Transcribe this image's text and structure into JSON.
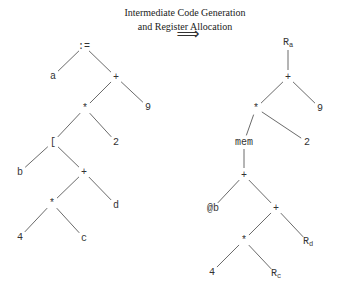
{
  "caption": {
    "line1": "Intermediate Code Generation",
    "line2": "and Register Allocation",
    "arrow": "⟹"
  },
  "left_tree": {
    "nodes": [
      {
        "id": "L0",
        "label": ":=",
        "x": 84,
        "y": 46
      },
      {
        "id": "L1",
        "label": "a",
        "x": 53,
        "y": 76
      },
      {
        "id": "L2",
        "label": "+",
        "x": 116,
        "y": 77
      },
      {
        "id": "L3",
        "label": "*",
        "x": 85,
        "y": 108
      },
      {
        "id": "L4",
        "label": "9",
        "x": 148,
        "y": 107
      },
      {
        "id": "L5",
        "label": "[",
        "x": 53,
        "y": 142
      },
      {
        "id": "L6",
        "label": "2",
        "x": 116,
        "y": 142
      },
      {
        "id": "L7",
        "label": "b",
        "x": 20,
        "y": 172
      },
      {
        "id": "L8",
        "label": "+",
        "x": 84,
        "y": 172
      },
      {
        "id": "L9",
        "label": "*",
        "x": 52,
        "y": 203
      },
      {
        "id": "L10",
        "label": "d",
        "x": 116,
        "y": 205
      },
      {
        "id": "L11",
        "label": "4",
        "x": 20,
        "y": 237
      },
      {
        "id": "L12",
        "label": "c",
        "x": 84,
        "y": 238
      }
    ],
    "edges": [
      [
        "L0",
        "L1"
      ],
      [
        "L0",
        "L2"
      ],
      [
        "L2",
        "L3"
      ],
      [
        "L2",
        "L4"
      ],
      [
        "L3",
        "L5"
      ],
      [
        "L3",
        "L6"
      ],
      [
        "L5",
        "L7"
      ],
      [
        "L5",
        "L8"
      ],
      [
        "L8",
        "L9"
      ],
      [
        "L8",
        "L10"
      ],
      [
        "L9",
        "L11"
      ],
      [
        "L9",
        "L12"
      ]
    ]
  },
  "right_tree": {
    "nodes": [
      {
        "id": "R0",
        "label": "R",
        "sub": "a",
        "x": 288,
        "y": 43
      },
      {
        "id": "R1",
        "label": "+",
        "x": 288,
        "y": 77
      },
      {
        "id": "R2",
        "label": "*",
        "x": 256,
        "y": 108
      },
      {
        "id": "R3",
        "label": "9",
        "x": 320,
        "y": 108
      },
      {
        "id": "R4",
        "label": "mem",
        "x": 244,
        "y": 142
      },
      {
        "id": "R5",
        "label": "2",
        "x": 307,
        "y": 142
      },
      {
        "id": "R6",
        "label": "+",
        "x": 244,
        "y": 175
      },
      {
        "id": "R7",
        "label": "@b",
        "x": 213,
        "y": 208
      },
      {
        "id": "R8",
        "label": "+",
        "x": 276,
        "y": 208
      },
      {
        "id": "R9",
        "label": "*",
        "x": 244,
        "y": 240
      },
      {
        "id": "R10",
        "label": "R",
        "sub": "d",
        "x": 308,
        "y": 242
      },
      {
        "id": "R11",
        "label": "4",
        "x": 212,
        "y": 272
      },
      {
        "id": "R12",
        "label": "R",
        "sub": "c",
        "x": 276,
        "y": 274
      }
    ],
    "edges": [
      [
        "R0",
        "R1"
      ],
      [
        "R1",
        "R2"
      ],
      [
        "R1",
        "R3"
      ],
      [
        "R2",
        "R4"
      ],
      [
        "R2",
        "R5"
      ],
      [
        "R4",
        "R6"
      ],
      [
        "R6",
        "R7"
      ],
      [
        "R6",
        "R8"
      ],
      [
        "R8",
        "R9"
      ],
      [
        "R8",
        "R10"
      ],
      [
        "R9",
        "R11"
      ],
      [
        "R9",
        "R12"
      ]
    ]
  }
}
